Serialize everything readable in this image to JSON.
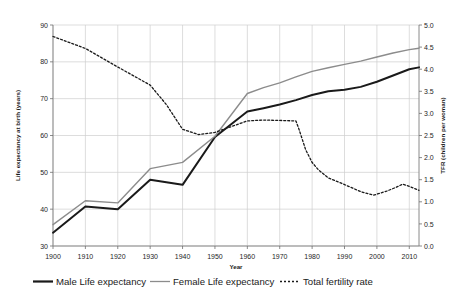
{
  "chart_data": {
    "type": "line",
    "title": "",
    "xlabel": "Year",
    "ylabel": "Life expectancy at birth (years)",
    "y2label": "TFR (children per woman)",
    "xlim": [
      1900,
      2013
    ],
    "ylim": [
      30,
      90
    ],
    "y2lim": [
      0.0,
      5.0
    ],
    "grid": true,
    "legend_position": "bottom",
    "xticks": [
      "1900",
      "1910",
      "1920",
      "1930",
      "1940",
      "1950",
      "1960",
      "1970",
      "1980",
      "1990",
      "2000",
      "2010"
    ],
    "xtick_values": [
      1900,
      1910,
      1920,
      1930,
      1940,
      1950,
      1960,
      1970,
      1980,
      1990,
      2000,
      2010
    ],
    "yticks": [
      "30",
      "40",
      "50",
      "60",
      "70",
      "80",
      "90"
    ],
    "ytick_values": [
      30,
      40,
      50,
      60,
      70,
      80,
      90
    ],
    "y2ticks": [
      "0.0",
      "0.5",
      "1.0",
      "1.5",
      "2.0",
      "2.5",
      "3.0",
      "3.5",
      "4.0",
      "4.5",
      "5.0"
    ],
    "y2tick_values": [
      0.0,
      0.5,
      1.0,
      1.5,
      2.0,
      2.5,
      3.0,
      3.5,
      4.0,
      4.5,
      5.0
    ],
    "series": [
      {
        "name": "Male Life expectancy",
        "axis": "left",
        "color": "#1a1a1a",
        "width": 2.0,
        "dash": "none",
        "x": [
          1900,
          1910,
          1920,
          1930,
          1940,
          1950,
          1960,
          1965,
          1970,
          1975,
          1980,
          1985,
          1990,
          1995,
          2000,
          2005,
          2010,
          2013
        ],
        "values": [
          33.6,
          40.7,
          40.0,
          48.0,
          46.6,
          59.6,
          66.5,
          67.4,
          68.4,
          69.6,
          71.0,
          72.0,
          72.4,
          73.2,
          74.6,
          76.3,
          78.0,
          78.5
        ]
      },
      {
        "name": "Female Life expectancy",
        "axis": "left",
        "color": "#8c8c8c",
        "width": 1.4,
        "dash": "none",
        "x": [
          1900,
          1910,
          1920,
          1930,
          1940,
          1950,
          1960,
          1965,
          1970,
          1975,
          1980,
          1985,
          1990,
          1995,
          2000,
          2005,
          2010,
          2013
        ],
        "values": [
          35.8,
          42.3,
          41.7,
          51.0,
          52.7,
          59.8,
          71.4,
          73.0,
          74.3,
          75.9,
          77.4,
          78.4,
          79.3,
          80.2,
          81.3,
          82.4,
          83.3,
          83.7
        ]
      },
      {
        "name": "Total fertility rate",
        "axis": "right",
        "color": "#1a1a1a",
        "width": 1.3,
        "dash": "2,2",
        "x": [
          1900,
          1910,
          1920,
          1930,
          1935,
          1940,
          1945,
          1950,
          1955,
          1960,
          1965,
          1970,
          1975,
          1976,
          1978,
          1980,
          1982,
          1985,
          1990,
          1995,
          1999,
          2003,
          2006,
          2008,
          2010,
          2013
        ],
        "values": [
          4.74,
          4.47,
          4.05,
          3.64,
          3.2,
          2.64,
          2.52,
          2.57,
          2.7,
          2.83,
          2.85,
          2.84,
          2.83,
          2.63,
          2.18,
          1.89,
          1.72,
          1.54,
          1.39,
          1.23,
          1.15,
          1.24,
          1.33,
          1.4,
          1.35,
          1.26
        ]
      }
    ],
    "legend": [
      {
        "label": "Male Life expectancy",
        "color": "#1a1a1a",
        "style": "solid-thick"
      },
      {
        "label": "Female Life expectancy",
        "color": "#8c8c8c",
        "style": "solid-thin"
      },
      {
        "label": "Total fertility rate",
        "color": "#1a1a1a",
        "style": "dotted"
      }
    ]
  }
}
